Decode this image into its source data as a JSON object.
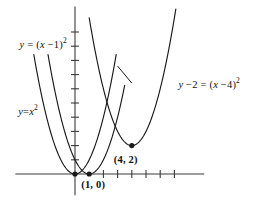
{
  "figure": {
    "background_color": "#ffffff",
    "stroke_color": "#1a1a1a",
    "axis_color": "#3a3a3a",
    "labels": {
      "curve_b_prefix": "y",
      "curve_b_equals": " = (",
      "curve_b_var": "x",
      "curve_b_rest": " −1)",
      "curve_b_exp": "2",
      "curve_a_prefix": "y",
      "curve_a_equals": "=",
      "curve_a_var": "x",
      "curve_a_exp": "2",
      "curve_c_prefix": "y",
      "curve_c_mid": " −2 = (",
      "curve_c_var": "x",
      "curve_c_rest": " −4)",
      "curve_c_exp": "2",
      "point_vertex_c": "(4,  2)",
      "point_vertex_b": "(1,  0)"
    }
  },
  "chart_data": {
    "type": "line",
    "title": "",
    "xlabel": "",
    "ylabel": "",
    "grid": false,
    "legend_position": "inline-annotations",
    "axes": {
      "x_axis_pixel_y": 174,
      "y_axis_pixel_x": 75,
      "x_unit_pixels": 14.2,
      "y_unit_pixels": 14.2,
      "xlim": [
        -4.2,
        9.1
      ],
      "ylim": [
        -1.5,
        11.8
      ],
      "x_ticks_right_of_origin": [
        2,
        3,
        4,
        5,
        6,
        7
      ],
      "x_ticks_left_of_origin": [],
      "y_ticks": [
        1,
        2,
        3,
        4,
        5,
        6,
        7,
        8,
        9,
        10
      ],
      "tick_half_length_px": 4
    },
    "series": [
      {
        "name": "y = x^2",
        "label": "y=x²",
        "equation": "y = x^2",
        "vertex": [
          0,
          0
        ],
        "a": 1,
        "h": 0,
        "k": 0,
        "x_range": [
          -2.9,
          2.9
        ],
        "label_anchor": [
          -4.0,
          4.5
        ],
        "marker_at_vertex": true
      },
      {
        "name": "y = (x-1)^2",
        "label": "y = (x −1)²",
        "equation": "y = (x - 1)^2",
        "vertex": [
          1,
          0
        ],
        "a": 1,
        "h": 1,
        "k": 0,
        "x_range": [
          -1.9,
          3.5
        ],
        "label_anchor": [
          -3.9,
          9.2
        ],
        "leader_line": [
          [
            3.0,
            7.6
          ],
          [
            4.0,
            6.4
          ]
        ],
        "marker_at_vertex": true
      },
      {
        "name": "y - 2 = (x-4)^2",
        "label": "y −2 = (x −4)²",
        "equation": "y = (x - 4)^2 + 2",
        "vertex": [
          4,
          2
        ],
        "a": 1,
        "h": 4,
        "k": 2,
        "x_range": [
          1.0,
          7.1
        ],
        "label_anchor": [
          7.0,
          6.4
        ],
        "marker_at_vertex": true
      }
    ],
    "annotated_points": [
      {
        "label": "(1,  0)",
        "x": 1,
        "y": 0
      },
      {
        "label": "(4,  2)",
        "x": 4,
        "y": 2
      },
      {
        "label": "",
        "x": 0,
        "y": 0
      }
    ]
  }
}
